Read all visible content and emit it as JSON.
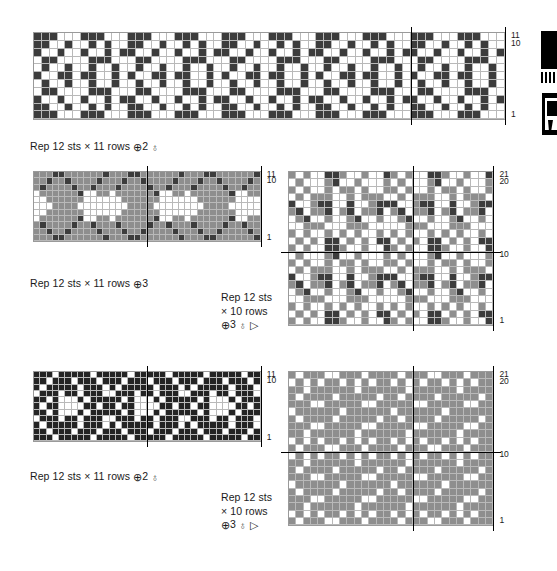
{
  "document": {
    "type": "knitting-colorwork-chart-page",
    "page_background": "#ffffff"
  },
  "palette": {
    "dark": "#3c3c3c",
    "medium": "#8e8e8e",
    "light": "#ffffff",
    "black": "#242424",
    "gridline": "#b9b9b9",
    "marker_line": "#000000",
    "text": "#1a1a1a"
  },
  "charts": [
    {
      "id": "chart-1",
      "position": "top",
      "columns": 60,
      "rows": 11,
      "row_labels": [
        {
          "text": "11",
          "row": 11
        },
        {
          "text": "10",
          "row": 10
        },
        {
          "text": "1",
          "row": 1
        }
      ],
      "repeat_markers": {
        "vertical_cols": [
          48
        ],
        "horizontal_rows": []
      },
      "caption": {
        "text": "Rep 12 sts × 11 rows",
        "symbol": "⊕",
        "count": "2",
        "extra_symbols": "♁"
      }
    },
    {
      "id": "chart-2",
      "position": "middle-left",
      "columns": 36,
      "rows": 11,
      "row_labels": [
        {
          "text": "11",
          "row": 11
        },
        {
          "text": "10",
          "row": 10
        },
        {
          "text": "1",
          "row": 1
        }
      ],
      "repeat_markers": {
        "vertical_cols": [
          18
        ],
        "horizontal_rows": []
      },
      "caption": {
        "text": "Rep 12 sts × 11 rows",
        "symbol": "⊕",
        "count": "3",
        "extra_symbols": ""
      }
    },
    {
      "id": "chart-3",
      "position": "middle-right",
      "columns": 28,
      "rows": 21,
      "row_labels": [
        {
          "text": "21",
          "row": 21
        },
        {
          "text": "20",
          "row": 20
        },
        {
          "text": "10",
          "row": 10
        },
        {
          "text": "1",
          "row": 1
        }
      ],
      "repeat_markers": {
        "vertical_cols": [
          17
        ],
        "horizontal_rows": [
          10
        ]
      },
      "caption": {
        "line1": "Rep 12 sts",
        "line2": "× 10 rows",
        "symbol": "⊕",
        "count": "3",
        "extra_symbols": "♁ ▷"
      }
    },
    {
      "id": "chart-4",
      "position": "bottom-left",
      "columns": 36,
      "rows": 11,
      "row_labels": [
        {
          "text": "11",
          "row": 11
        },
        {
          "text": "10",
          "row": 10
        },
        {
          "text": "1",
          "row": 1
        }
      ],
      "repeat_markers": {
        "vertical_cols": [
          18
        ],
        "horizontal_rows": []
      },
      "caption": {
        "text": "Rep 12 sts × 11 rows",
        "symbol": "⊕",
        "count": "2",
        "extra_symbols": "♁"
      }
    },
    {
      "id": "chart-5",
      "position": "bottom-right",
      "columns": 28,
      "rows": 21,
      "row_labels": [
        {
          "text": "21",
          "row": 21
        },
        {
          "text": "20",
          "row": 20
        },
        {
          "text": "10",
          "row": 10
        },
        {
          "text": "1",
          "row": 1
        }
      ],
      "repeat_markers": {
        "vertical_cols": [
          17
        ],
        "horizontal_rows": [
          10
        ]
      },
      "caption": {
        "line1": "Rep 12 sts",
        "line2": "× 10 rows",
        "symbol": "⊕",
        "count": "3",
        "extra_symbols": "♁ ▷"
      }
    }
  ],
  "chart_data": {
    "type": "heatmap",
    "legend": [
      "dark",
      "medium",
      "light"
    ],
    "grids": {
      "chart-1": {
        "colors": [
          "dark",
          "light"
        ],
        "tile_cols": 12,
        "tile_rows": 11,
        "tile": [
          "dddllldddlll",
          "ddlldlldldll",
          "dlldlldlldld",
          "lddlllldddll",
          "ldlldlldlldl",
          "dllddlddlldl",
          "ldlldlldlldl",
          "lddlllldddll",
          "dlldlldlldld",
          "ddlldlldldll",
          "dddllldddlll"
        ]
      },
      "chart-2": {
        "colors": [
          "dark",
          "medium",
          "light"
        ],
        "tile_cols": 12,
        "tile_rows": 11,
        "tile": [
          "mmmddmmmmmmd",
          "mmdmmdmmmmdm",
          "mdmmmmdmmdmm",
          "lmmmmmmdllmm",
          "llmmmmmmllll",
          "lllmmmmlllll",
          "llmmmmmmllll",
          "lmmmmmmdllmm",
          "mdmmmmdmmdmm",
          "mmdmmdmmmmdm",
          "mmmddmmmmmmd"
        ]
      },
      "chart-3": {
        "colors": [
          "dark",
          "medium",
          "light"
        ],
        "tile_cols": 14,
        "tile_rows": 10,
        "tile": [
          "mlmllddmllmlld",
          "lmlmlddlmlmldd",
          "mlmllmlmlmllml",
          "llmmmlllmmmlll",
          "lmdllmllmdllml",
          "mdlmmdlmdlmmdl",
          "dllmddlldllmdd",
          "lmlmmmllmlmmml",
          "mlmllmlmmlmllm",
          "lmlllmdllmlllm"
        ]
      },
      "chart-4": {
        "colors": [
          "black",
          "light"
        ],
        "tile_cols": 12,
        "tile_rows": 11,
        "tile": [
          "kkklkkkkklkk",
          "kklkkklkkklk",
          "klkkkkklkkkl",
          "lkkklkklkkkl",
          "kklklllklkkk",
          "klkkllllkklk",
          "kklklllklkkk",
          "lkkklkklkkkl",
          "klkkkkklkkkl",
          "kklkkklkkklk",
          "kkklkkkkklkk"
        ]
      },
      "chart-5": {
        "colors": [
          "medium",
          "light"
        ],
        "tile_cols": 14,
        "tile_rows": 10,
        "tile": [
          "mlmmmllmmmlmmm",
          "lmlmlmmlmlmlmm",
          "mmlmmmmmmlmmmm",
          "mmmllmmmmmllmm",
          "mlmmmmlmmmmmlm",
          "lmmmmmmlmmmmmm",
          "mmmllmmmmmllmm",
          "mlmmmmlmmmmmlm",
          "mmlmmmmmmlmmmm",
          "lmlmlmmlmlmlmm"
        ]
      }
    }
  },
  "edge_graphics": [
    {
      "name": "bleed-thumb-top",
      "description": "cropped black graphic"
    },
    {
      "name": "bleed-thumb-bottom",
      "description": "cropped black graphic"
    }
  ]
}
